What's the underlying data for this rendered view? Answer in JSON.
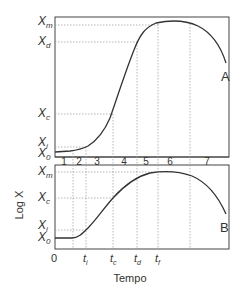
{
  "diagram": {
    "x_axis_label": "Tempo",
    "y_axis_label": "Log X",
    "panel_a_label": "A",
    "panel_b_label": "B",
    "phase_numbers": [
      "1",
      "2",
      "3",
      "4",
      "5",
      "6",
      "7"
    ],
    "panel_a_y_ticks": [
      {
        "base": "X",
        "sub": "m"
      },
      {
        "base": "X",
        "sub": "d"
      },
      {
        "base": "X",
        "sub": "c"
      },
      {
        "base": "X",
        "sub": "i"
      },
      {
        "base": "X",
        "sub": "0"
      }
    ],
    "panel_b_y_ticks": [
      {
        "base": "X",
        "sub": "m"
      },
      {
        "base": "X",
        "sub": "c"
      },
      {
        "base": "X",
        "sub": "i"
      },
      {
        "base": "X",
        "sub": "0"
      }
    ],
    "x_ticks": [
      {
        "base": "0",
        "sub": ""
      },
      {
        "base": "t",
        "sub": "i"
      },
      {
        "base": "t",
        "sub": "c"
      },
      {
        "base": "t",
        "sub": "d"
      },
      {
        "base": "t",
        "sub": "f"
      }
    ]
  },
  "colors": {
    "line": "#333333",
    "grid": "#888888"
  }
}
